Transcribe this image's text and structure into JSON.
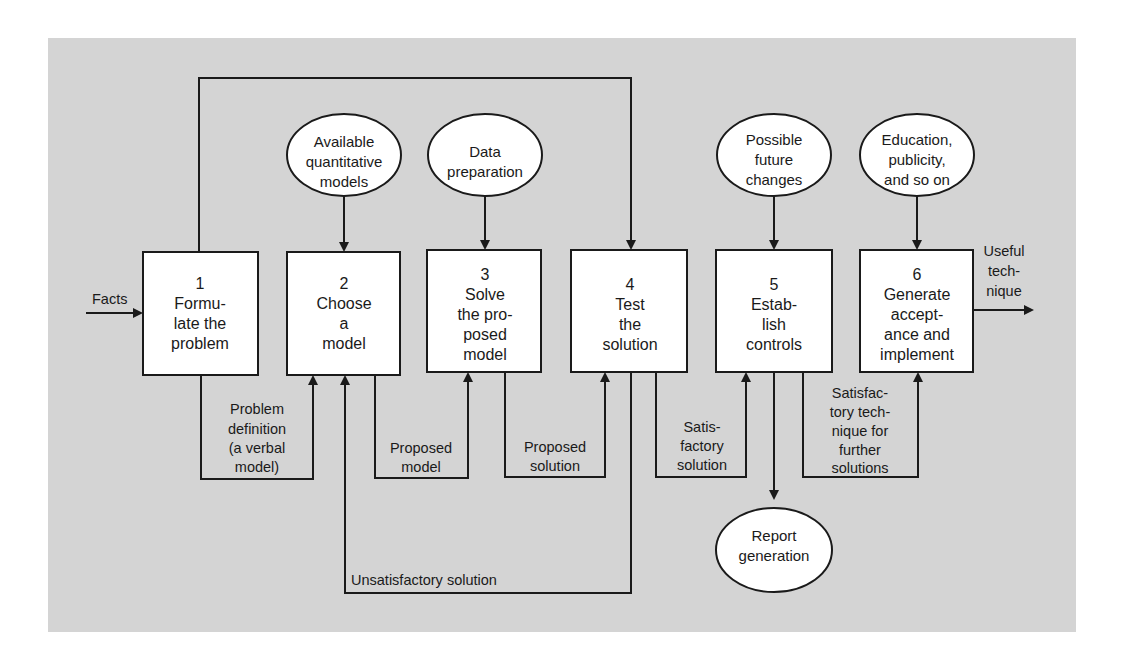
{
  "diagram": {
    "title": "",
    "colors": {
      "panel": "#d4d4d4",
      "line": "#1a1a1a",
      "fill": "#ffffff"
    },
    "input": {
      "label": "Facts"
    },
    "output": {
      "label_lines": [
        "Useful",
        "tech-",
        "nique"
      ]
    },
    "steps": [
      {
        "number": "1",
        "lines": [
          "Formu-",
          "late the",
          "problem"
        ]
      },
      {
        "number": "2",
        "lines": [
          "Choose",
          "a",
          "model"
        ]
      },
      {
        "number": "3",
        "lines": [
          "Solve",
          "the pro-",
          "posed",
          "model"
        ]
      },
      {
        "number": "4",
        "lines": [
          "Test",
          "the",
          "solution"
        ]
      },
      {
        "number": "5",
        "lines": [
          "Estab-",
          "lish",
          "controls"
        ]
      },
      {
        "number": "6",
        "lines": [
          "Generate",
          "accept-",
          "ance and",
          "implement"
        ]
      }
    ],
    "inputs_top": [
      {
        "target_step": "2",
        "lines": [
          "Available",
          "quantitative",
          "models"
        ]
      },
      {
        "target_step": "3",
        "lines": [
          "Data",
          "preparation"
        ]
      },
      {
        "target_step": "5",
        "lines": [
          "Possible",
          "future",
          "changes"
        ]
      },
      {
        "target_step": "6",
        "lines": [
          "Education,",
          "publicity,",
          "and so on"
        ]
      }
    ],
    "outputs_bottom": [
      {
        "source_step": "5",
        "lines": [
          "Report",
          "generation"
        ]
      }
    ],
    "connectors": [
      {
        "from": "1",
        "to": "2",
        "lines": [
          "Problem",
          "definition",
          "(a verbal",
          "model)"
        ]
      },
      {
        "from": "2",
        "to": "3",
        "lines": [
          "Proposed",
          "model"
        ]
      },
      {
        "from": "3",
        "to": "4",
        "lines": [
          "Proposed",
          "solution"
        ]
      },
      {
        "from": "4",
        "to": "5",
        "lines": [
          "Satis-",
          "factory",
          "solution"
        ]
      },
      {
        "from": "5",
        "to": "6",
        "lines": [
          "Satisfac-",
          "tory tech-",
          "nique for",
          "further",
          "solutions"
        ]
      }
    ],
    "feedback": [
      {
        "from": "1",
        "to": "4",
        "route": "top",
        "label": ""
      },
      {
        "from": "4",
        "to": "2",
        "route": "bottom",
        "label": "Unsatisfactory solution"
      }
    ]
  }
}
